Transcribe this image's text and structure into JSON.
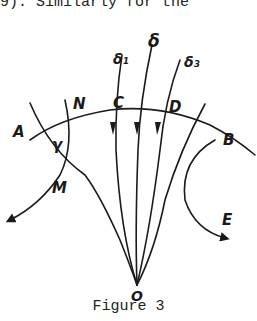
{
  "header": {
    "text": "9). Similarly for the"
  },
  "figure": {
    "caption": "Figure 3",
    "labels": {
      "delta": "δ",
      "delta1": "δ₁",
      "delta3": "δ₃",
      "A": "A",
      "N": "N",
      "C": "C",
      "D": "D",
      "B": "B",
      "gamma": "γ",
      "M": "M",
      "E": "E",
      "O": "O"
    }
  }
}
